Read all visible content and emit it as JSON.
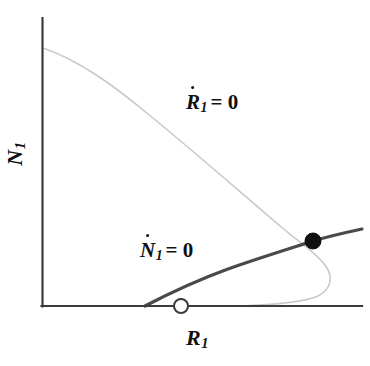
{
  "figure": {
    "type": "phase-plane-diagram",
    "background_color": "#ffffff",
    "axes": {
      "x_label": "R",
      "x_label_sub": "1",
      "y_label": "N",
      "y_label_sub": "1",
      "axis_color": "#3b3b3b",
      "x_axis": {
        "x_start": 42,
        "x_end": 362,
        "y": 306
      },
      "y_axis": {
        "x": 42,
        "y_start": 18,
        "y_end": 306
      }
    },
    "curves": [
      {
        "name": "R1-nullcline",
        "label_var": "R",
        "label_sub": "1",
        "label_eq": "= 0",
        "color": "#c9c9c9",
        "stroke_width": 1.6,
        "label_position": {
          "x": 186,
          "y": 92
        },
        "description": "resource nullcline, hooked/backward-bending curve"
      },
      {
        "name": "N1-nullcline",
        "label_var": "N",
        "label_sub": "1",
        "label_eq": "= 0",
        "color": "#4a4a4a",
        "stroke_width": 3.2,
        "label_position": {
          "x": 140,
          "y": 240
        },
        "description": "consumer nullcline, rising saturating curve"
      }
    ],
    "points": [
      {
        "name": "stable-equilibrium",
        "style": "filled-circle",
        "fill": "#111111",
        "stroke": "#111111",
        "radius": 8,
        "x": 313,
        "y": 241
      },
      {
        "name": "unstable-equilibrium",
        "style": "open-circle",
        "fill": "#ffffff",
        "stroke": "#3b3b3b",
        "radius": 7,
        "x": 181,
        "y": 306
      }
    ]
  },
  "chart_data": {
    "type": "line",
    "title": "",
    "xlabel": "R₁",
    "ylabel": "N₁",
    "grid": false,
    "legend": "inline-annotations",
    "xlim": [
      42,
      362
    ],
    "ylim": [
      306,
      18
    ],
    "annotations": [
      {
        "text": "Ṡ₁ = 0",
        "x": 186,
        "y": 92
      },
      {
        "text": "Ṅ₁ = 0",
        "x": 140,
        "y": 240
      }
    ],
    "series": [
      {
        "name": "R1-nullcline",
        "color": "#c9c9c9",
        "points": [
          [
            43,
            48
          ],
          [
            70,
            58
          ],
          [
            100,
            76
          ],
          [
            130,
            98
          ],
          [
            160,
            124
          ],
          [
            190,
            152
          ],
          [
            220,
            180
          ],
          [
            250,
            206
          ],
          [
            280,
            228
          ],
          [
            300,
            240
          ],
          [
            313,
            249
          ],
          [
            322,
            258
          ],
          [
            329,
            270
          ],
          [
            330,
            281
          ],
          [
            324,
            291
          ],
          [
            310,
            298
          ],
          [
            290,
            302
          ],
          [
            265,
            304
          ],
          [
            235,
            305
          ],
          [
            205,
            306
          ]
        ]
      },
      {
        "name": "N1-nullcline",
        "color": "#4a4a4a",
        "points": [
          [
            145,
            306
          ],
          [
            165,
            295
          ],
          [
            185,
            286
          ],
          [
            210,
            275
          ],
          [
            240,
            264
          ],
          [
            270,
            254
          ],
          [
            300,
            245
          ],
          [
            313,
            241
          ],
          [
            330,
            237
          ],
          [
            345,
            233
          ],
          [
            362,
            229
          ]
        ]
      }
    ],
    "markers": [
      {
        "name": "stable-equilibrium",
        "x": 313,
        "y": 241,
        "style": "filled"
      },
      {
        "name": "unstable-equilibrium",
        "x": 181,
        "y": 306,
        "style": "open"
      }
    ]
  }
}
